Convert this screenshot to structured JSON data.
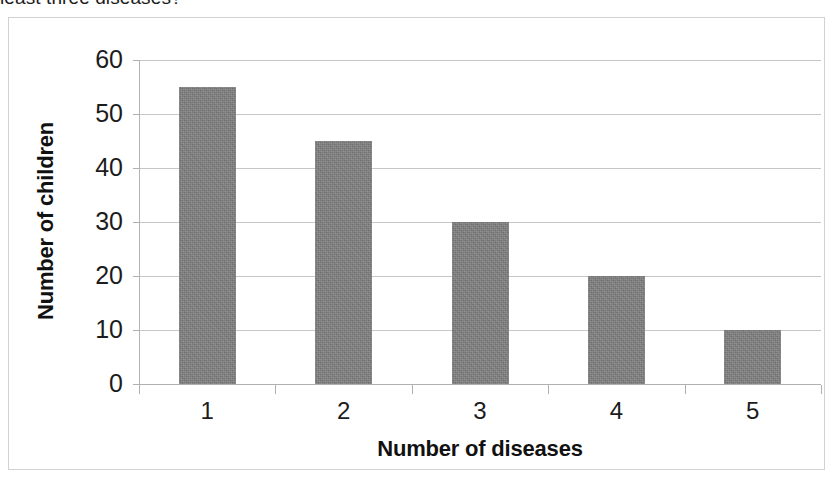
{
  "page": {
    "cutoff_question_text": "least three diseases?"
  },
  "chart_data": {
    "type": "bar",
    "title": "",
    "categories": [
      "1",
      "2",
      "3",
      "4",
      "5"
    ],
    "values": [
      55,
      45,
      30,
      20,
      10
    ],
    "xlabel": "Number of diseases",
    "ylabel": "Number of children",
    "ylim": [
      0,
      60
    ],
    "ytick_labels": [
      "60",
      "50",
      "40",
      "30",
      "20",
      "10",
      "0"
    ],
    "ytick_values": [
      60,
      50,
      40,
      30,
      20,
      10,
      0
    ],
    "ystep": 10,
    "grid": "horizontal",
    "legend": "none",
    "bar_color": "#808080",
    "gridline_color": "#c6c6c6",
    "axis_color": "#b0b0b0",
    "frame_color": "#d2d2d2",
    "text_color": "#1c1c1c"
  }
}
